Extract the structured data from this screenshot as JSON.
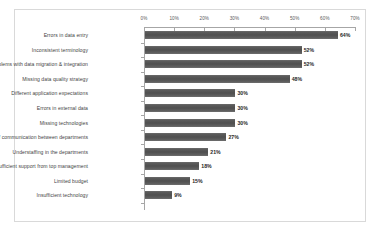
{
  "chart_data": {
    "type": "bar",
    "orientation": "horizontal",
    "title": "",
    "subtitle": "",
    "xlabel": "",
    "ylabel": "",
    "xlim": [
      0,
      70
    ],
    "grid": false,
    "legend": null,
    "value_suffix": "%",
    "axis_position": "top",
    "categories": [
      "Errors in data entry",
      "Inconsistent terminology",
      "Problems with data migration & integration",
      "Missing data quality strategy",
      "Different application expectations",
      "Errors in external data",
      "Missing technologies",
      "Lack of communication between departments",
      "Understaffing in the departments",
      "Insufficient support from top management",
      "Limited budget",
      "Insufficient technology"
    ],
    "values": [
      64,
      52,
      52,
      48,
      30,
      30,
      30,
      27,
      21,
      18,
      15,
      9
    ],
    "data_labels": [
      "64%",
      "52%",
      "52%",
      "48%",
      "30%",
      "30%",
      "30%",
      "27%",
      "21%",
      "18%",
      "15%",
      "9%"
    ],
    "xticks": [
      0,
      10,
      20,
      30,
      40,
      50,
      60,
      70
    ],
    "xtick_labels": [
      "0%",
      "10%",
      "20%",
      "30%",
      "40%",
      "50%",
      "60%",
      "70%"
    ],
    "colors": {
      "bar": "#595959",
      "frame": "#d9d9d9",
      "axis": "#a6a6a6",
      "category_text": "#3f3f3f",
      "tick_text": "#595959",
      "value_text": "#262626",
      "background": "#ffffff"
    }
  }
}
